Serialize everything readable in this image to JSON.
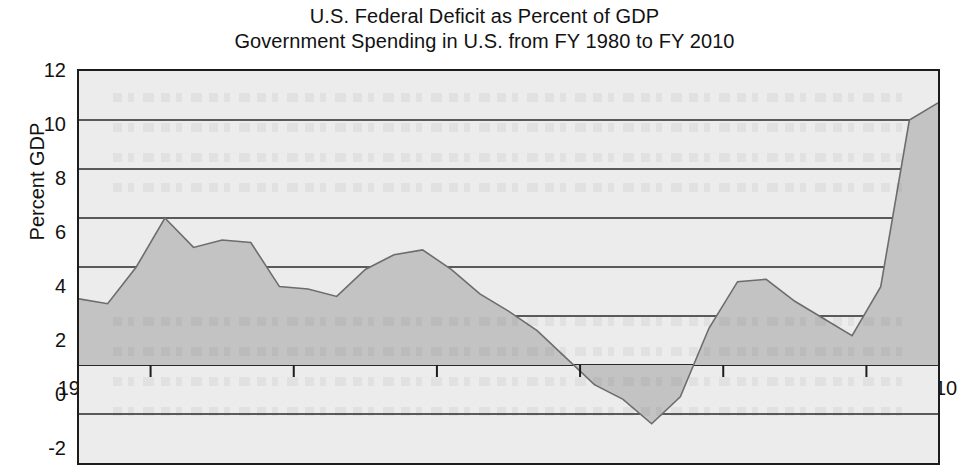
{
  "figure": {
    "title_lines": [
      "U.S. Federal Deficit as Percent of GDP",
      "Government Spending in U.S. from FY 1980 to FY 2010"
    ]
  },
  "axes": {
    "ylabel": "Percent GDP",
    "xlabel": "",
    "y_ticks": [
      "12",
      "10",
      "8",
      "6",
      "4",
      "2",
      "0",
      "-2",
      "-4"
    ],
    "x_ticks": [
      "1980",
      "1985",
      "1990",
      "1995",
      "2000",
      "2005",
      "2010"
    ]
  },
  "colors": {
    "area_fill": "#c3c3c3",
    "plot_background": "#ececec",
    "axis_line": "#1c1c1c",
    "gridline": "#2a2a2a",
    "text": "#121212",
    "page_background": "#ffffff"
  },
  "chart_data": {
    "type": "area",
    "xlabel": "",
    "ylabel": "Percent GDP",
    "xlim": [
      1980,
      2010
    ],
    "ylim": [
      -4,
      12
    ],
    "y_major_ticks": [
      -4,
      -2,
      0,
      2,
      4,
      6,
      8,
      10,
      12
    ],
    "y_minor_ticks": [
      -3,
      -1,
      1,
      3,
      5,
      7,
      9,
      11
    ],
    "x_major_ticks": [
      1980,
      1985,
      1990,
      1995,
      2000,
      2005,
      2010
    ],
    "x_minor_ticks": [
      1982.5,
      1987.5,
      1992.5,
      1997.5,
      2002.5,
      2007.5
    ],
    "grid": "horizontal",
    "legend": null,
    "baseline": 0,
    "x": [
      1980,
      1981,
      1982,
      1983,
      1984,
      1985,
      1986,
      1987,
      1988,
      1989,
      1990,
      1991,
      1992,
      1993,
      1994,
      1995,
      1996,
      1997,
      1998,
      1999,
      2000,
      2001,
      2002,
      2003,
      2004,
      2005,
      2006,
      2007,
      2008,
      2009,
      2010
    ],
    "values": [
      2.7,
      2.5,
      4.0,
      6.0,
      4.8,
      5.1,
      5.0,
      3.2,
      3.1,
      2.8,
      3.9,
      4.5,
      4.7,
      3.9,
      2.9,
      2.2,
      1.4,
      0.3,
      -0.8,
      -1.4,
      -2.4,
      -1.3,
      1.5,
      3.4,
      3.5,
      2.6,
      1.9,
      1.2,
      3.2,
      10.0,
      10.7
    ],
    "series": [
      {
        "name": "Federal Deficit (Percent of GDP)",
        "values": [
          2.7,
          2.5,
          4.0,
          6.0,
          4.8,
          5.1,
          5.0,
          3.2,
          3.1,
          2.8,
          3.9,
          4.5,
          4.7,
          3.9,
          2.9,
          2.2,
          1.4,
          0.3,
          -0.8,
          -1.4,
          -2.4,
          -1.3,
          1.5,
          3.4,
          3.5,
          2.6,
          1.9,
          1.2,
          3.2,
          10.0,
          10.7
        ]
      }
    ],
    "notes": {
      "peak_early": {
        "year": 1983,
        "value": 6.0
      },
      "surplus_minimum": {
        "year": 2000,
        "value": -2.4
      },
      "peak_late": {
        "year": 2010,
        "value": 10.7
      }
    }
  }
}
